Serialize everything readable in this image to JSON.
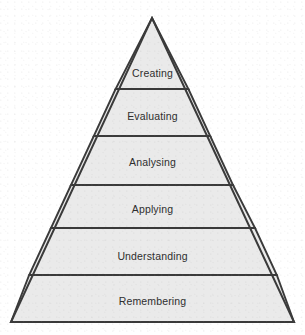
{
  "diagram": {
    "type": "pyramid",
    "background_color": "#ffffff",
    "fill_color": "#eaeaea",
    "stroke_color": "#3a3a3a",
    "text_color": "#2e2e2e",
    "geometry": {
      "apex": {
        "x": 152,
        "y": 18
      },
      "base_left": {
        "x": 11,
        "y": 322
      },
      "base_right": {
        "x": 294,
        "y": 322
      },
      "divider_y": [
        89,
        136,
        185,
        228,
        275
      ]
    },
    "tiers": [
      {
        "index": 1,
        "label": "Creating",
        "label_y": 67,
        "top_y": 18,
        "bottom_y": 89
      },
      {
        "index": 2,
        "label": "Evaluating",
        "label_y": 110,
        "top_y": 89,
        "bottom_y": 136
      },
      {
        "index": 3,
        "label": "Analysing",
        "label_y": 156,
        "top_y": 136,
        "bottom_y": 185
      },
      {
        "index": 4,
        "label": "Applying",
        "label_y": 203,
        "top_y": 185,
        "bottom_y": 228
      },
      {
        "index": 5,
        "label": "Understanding",
        "label_y": 250,
        "top_y": 228,
        "bottom_y": 275
      },
      {
        "index": 6,
        "label": "Remembering",
        "label_y": 295,
        "top_y": 275,
        "bottom_y": 322
      }
    ]
  }
}
